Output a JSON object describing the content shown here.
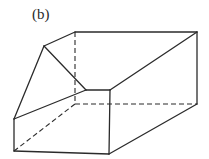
{
  "figure": {
    "label": "(b)",
    "stroke_color": "#2b2b2b",
    "background": "#ffffff"
  },
  "vertices": {
    "A": [
      75,
      32
    ],
    "B": [
      197,
      32
    ],
    "C": [
      44,
      46
    ],
    "D": [
      86,
      90
    ],
    "E": [
      110,
      90
    ],
    "F": [
      14,
      119
    ],
    "G": [
      14,
      151
    ],
    "H": [
      109,
      154
    ],
    "I": [
      197,
      104
    ],
    "J": [
      75,
      104
    ]
  },
  "edges": {
    "solid": [
      [
        "A",
        "B"
      ],
      [
        "A",
        "C"
      ],
      [
        "C",
        "D"
      ],
      [
        "C",
        "F"
      ],
      [
        "F",
        "D"
      ],
      [
        "D",
        "E"
      ],
      [
        "E",
        "B"
      ],
      [
        "B",
        "I"
      ],
      [
        "F",
        "G"
      ],
      [
        "G",
        "H"
      ],
      [
        "E",
        "H"
      ],
      [
        "H",
        "I"
      ]
    ],
    "dashed": [
      [
        "A",
        "J"
      ],
      [
        "J",
        "I"
      ],
      [
        "J",
        "G"
      ]
    ]
  }
}
